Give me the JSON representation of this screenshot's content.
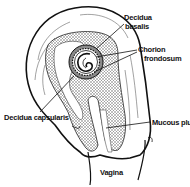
{
  "diagram": {
    "labels": {
      "decidua_basalis": [
        "Decidua",
        "basalis"
      ],
      "chorion_frondosum": [
        "Chorion",
        "frondosum"
      ],
      "decidua_capsularis": "Decidua capsularis",
      "mucous_plug": "Mucous plug",
      "vagina": "Vagina"
    },
    "colors": {
      "ink": "#111111",
      "shade": "#8a8a8a",
      "background": "#ffffff"
    }
  }
}
